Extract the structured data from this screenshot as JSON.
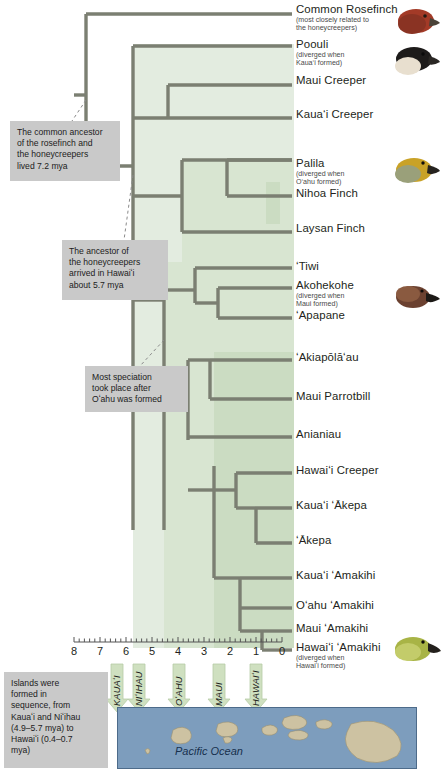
{
  "figure": {
    "kind": "phylogenetic-tree",
    "ocean_label": "Pacific Ocean"
  },
  "taxa": [
    {
      "name": "Common Rosefinch",
      "note": "(most closely related to\nthe honeycreepers)",
      "y": 12,
      "bird": "rosefinch"
    },
    {
      "name": "Poouli",
      "note": "(diverged when\nKaua‘i formed)",
      "y": 47,
      "bird": "poouli"
    },
    {
      "name": "Maui Creeper",
      "note": "",
      "y": 83,
      "bird": ""
    },
    {
      "name": "Kaua‘i Creeper",
      "note": "",
      "y": 117,
      "bird": ""
    },
    {
      "name": "Palila",
      "note": "(diverged when\nO‘ahu formed)",
      "y": 166,
      "bird": "palila"
    },
    {
      "name": "Nihoa Finch",
      "note": "",
      "y": 196,
      "bird": ""
    },
    {
      "name": "Laysan Finch",
      "note": "",
      "y": 231,
      "bird": ""
    },
    {
      "name": "ʻTiwi",
      "note": "",
      "y": 269,
      "bird": ""
    },
    {
      "name": "Akohekohe",
      "note": "(diverged when\nMaui formed)",
      "y": 288,
      "bird": "akohekohe"
    },
    {
      "name": "ʻApapane",
      "note": "",
      "y": 318,
      "bird": ""
    },
    {
      "name": "ʻAkiapōlāʻau",
      "note": "",
      "y": 360,
      "bird": ""
    },
    {
      "name": "Maui Parrotbill",
      "note": "",
      "y": 399,
      "bird": ""
    },
    {
      "name": "Anianiau",
      "note": "",
      "y": 437,
      "bird": ""
    },
    {
      "name": "Hawaiʻi Creeper",
      "note": "",
      "y": 473,
      "bird": ""
    },
    {
      "name": "Kauaʻi ʻĀkepa",
      "note": "",
      "y": 508,
      "bird": ""
    },
    {
      "name": "ʻĀkepa",
      "note": "",
      "y": 543,
      "bird": ""
    },
    {
      "name": "Kauaʻi ʻAmakihi",
      "note": "",
      "y": 578,
      "bird": ""
    },
    {
      "name": "Oʻahu ʻAmakihi",
      "note": "",
      "y": 608,
      "bird": ""
    },
    {
      "name": "Maui ʻAmakihi",
      "note": "",
      "y": 631,
      "bird": ""
    },
    {
      "name": "Hawaiʻi ʻAmakihi",
      "note": "(diverged when\nHawaiʻi formed)",
      "y": 650,
      "bird": "amakihi"
    }
  ],
  "callouts": [
    {
      "id": "rosefinch-ancestor",
      "text": "The common ancestor\nof the rosefinch and\nthe honeycreepers\nlived 7.2 mya",
      "x": 10,
      "y": 121,
      "w": 110,
      "h": 60
    },
    {
      "id": "honeycreeper-arrival",
      "text": "The ancestor of\nthe honeycreepers\narrived in Hawaiʻi\nabout 5.7 mya",
      "x": 62,
      "y": 240,
      "w": 106,
      "h": 60
    },
    {
      "id": "speciation",
      "text": "Most speciation\ntook place after\nOʻahu was formed",
      "x": 85,
      "y": 366,
      "w": 103,
      "h": 46
    }
  ],
  "island_box": {
    "text": "Islands were\nformed in\nsequence, from\nKauaʻi and Niʻihau\n(4.9–5.7 mya) to\nHawaiʻi (0.4–0.7\nmya)"
  },
  "axis": {
    "label": "",
    "ticks": [
      8,
      7,
      6,
      5,
      4,
      3,
      2,
      1,
      0
    ],
    "minor_per_interval": 4,
    "x_at_8": 74,
    "px_per_unit": 26.0,
    "unit": "mya"
  },
  "islands": [
    {
      "name": "KAUAʻI",
      "mya": 5.9,
      "x": 117
    },
    {
      "name": "NIʻIHAU",
      "mya": 5.5,
      "x": 139
    },
    {
      "name": "OʻAHU",
      "mya": 3.95,
      "x": 179
    },
    {
      "name": "MAUI",
      "mya": 2.4,
      "x": 219
    },
    {
      "name": "HAWAIʻI",
      "mya": 1.0,
      "x": 256
    }
  ],
  "colors": {
    "branch": "#7b7f72",
    "clade_fill_1": "#e2ebdd",
    "clade_fill_2": "#d6e3cf",
    "clade_fill_3": "#cadcc2",
    "callout_bg": "#c9c9c9",
    "ocean": "#7d9dbd",
    "land": "#cdc2a2",
    "arrow": "#cfe0c0"
  },
  "chart_data": {
    "type": "tree",
    "title": "",
    "xlabel": "million years ago (mya)",
    "xlim": [
      8,
      0
    ],
    "grid": false,
    "nodes": [
      {
        "id": "root",
        "mya": 7.2,
        "children": [
          "Common Rosefinch",
          "honeycreepers"
        ]
      },
      {
        "id": "honeycreepers",
        "mya": 5.7,
        "children": [
          "Poouli-clade",
          "core"
        ]
      },
      {
        "id": "Poouli-clade",
        "mya": 4.9,
        "children": [
          "Poouli",
          "creepers"
        ]
      },
      {
        "id": "creepers",
        "mya": 4.3,
        "children": [
          "Maui Creeper",
          "Kauaʻi Creeper"
        ]
      }
    ]
  }
}
